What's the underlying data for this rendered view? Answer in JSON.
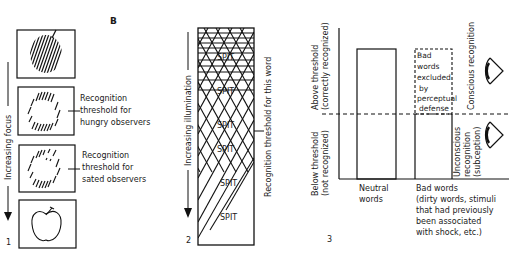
{
  "figure_letter": "B",
  "panel1": {
    "number": "1",
    "axis_label": "Increasing focus",
    "label_hungry": [
      "Recognition",
      "threshold for",
      "hungry observers"
    ],
    "label_sated": [
      "Recognition",
      "threshold for",
      "sated observers"
    ]
  },
  "panel2": {
    "number": "2",
    "axis_label": "Increasing illumination",
    "threshold_label": "Recognition threshold for this word",
    "word": "SPIT"
  },
  "panel3": {
    "number": "3",
    "y_upper_label": [
      "Above threshold",
      "(correctly recognized)"
    ],
    "y_lower_label": [
      "Below threshold",
      "(not recognized)"
    ],
    "right_upper_label": "Conscious recognition",
    "right_lower_label": [
      "Unconscious",
      "recognition",
      "(subception)"
    ],
    "defense_box_label": [
      "Bad",
      "words",
      "excluded",
      "by",
      "perceptual",
      "defense"
    ],
    "x_label_neutral": [
      "Neutral",
      "words"
    ],
    "x_label_bad": [
      "Bad words",
      "(dirty words, stimuli",
      "that had previously",
      "been associated",
      "with shock, etc.)"
    ],
    "icons": [
      "eye-icon-conscious",
      "eye-icon-unconscious"
    ]
  }
}
